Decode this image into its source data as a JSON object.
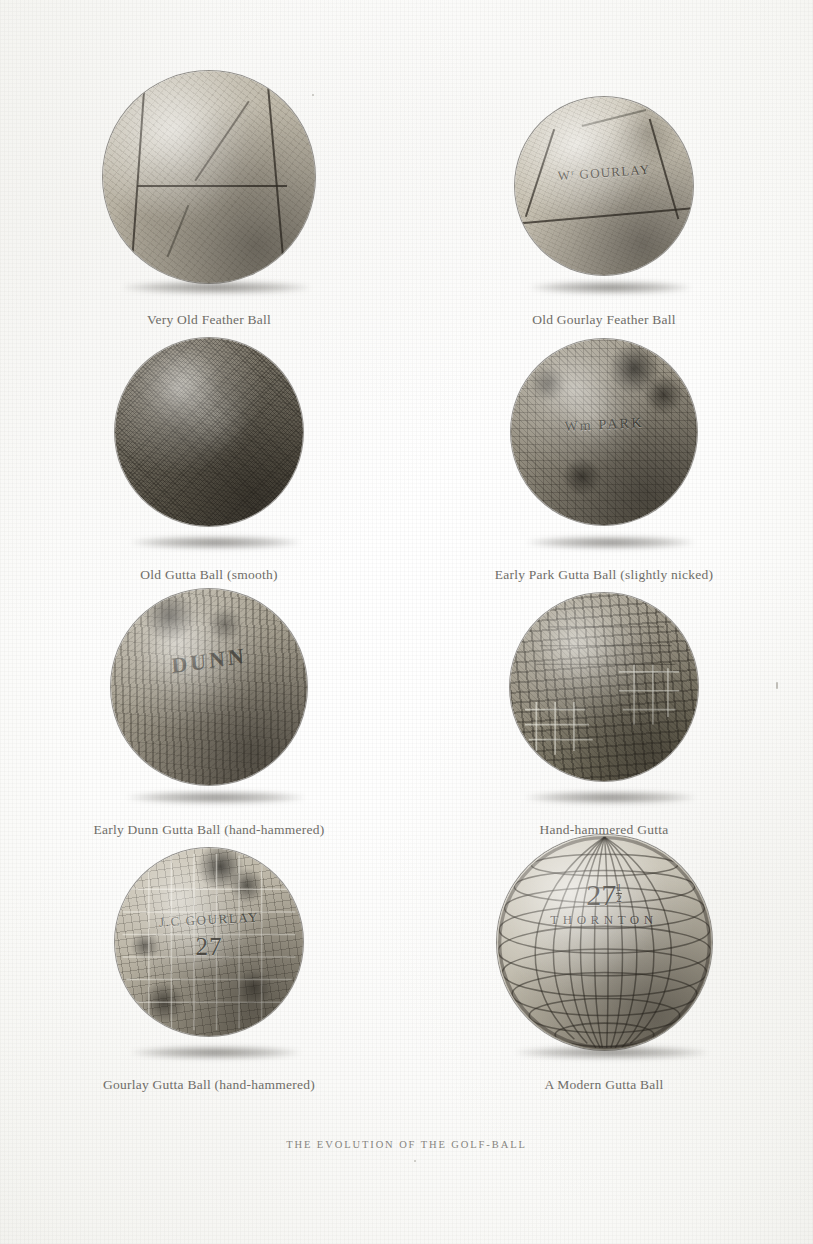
{
  "plate": {
    "title": "THE EVOLUTION OF THE GOLF-BALL",
    "background_color": "#fdfdfc",
    "ink_color": "#6f6d68",
    "columns": 2,
    "rows": 4,
    "total_figures": 8
  },
  "figures": [
    {
      "id": "very-old-feather-ball",
      "caption": "Very Old Feather Ball",
      "row": 1,
      "column": "left",
      "diameter_px": 212,
      "surface": "leather-panelled",
      "stamp": "",
      "base_color": "#bdb7a8"
    },
    {
      "id": "old-gourlay-feather-ball",
      "caption": "Old Gourlay Feather Ball",
      "row": 1,
      "column": "right",
      "diameter_px": 178,
      "surface": "leather-panelled",
      "stamp": "W GOURLAY",
      "stamp_prefix": "W",
      "stamp_superscript": "r",
      "stamp_main": "GOURLAY",
      "base_color": "#c6c0b1"
    },
    {
      "id": "old-gutta-ball-smooth",
      "caption": "Old Gutta Ball (smooth)",
      "row": 2,
      "column": "left",
      "diameter_px": 188,
      "surface": "smooth-stippled",
      "stamp": "",
      "base_color": "#6f6a5e"
    },
    {
      "id": "early-park-gutta-ball",
      "caption": "Early Park Gutta Ball (slightly nicked)",
      "row": 2,
      "column": "right",
      "diameter_px": 186,
      "surface": "slightly-nicked",
      "stamp": "Wm PARK",
      "base_color": "#938d7f"
    },
    {
      "id": "early-dunn-gutta-ball",
      "caption": "Early Dunn Gutta Ball (hand-hammered)",
      "row": 3,
      "column": "left",
      "diameter_px": 196,
      "surface": "hand-hammered-vertical",
      "stamp": "DUNN",
      "base_color": "#a49e8f"
    },
    {
      "id": "hand-hammered-gutta",
      "caption": "Hand-hammered Gutta",
      "row": 3,
      "column": "right",
      "diameter_px": 188,
      "surface": "hand-hammered-lattice",
      "stamp": "",
      "base_color": "#979182"
    },
    {
      "id": "gourlay-gutta-ball",
      "caption": "Gourlay Gutta Ball (hand-hammered)",
      "row": 4,
      "column": "left",
      "diameter_px": 188,
      "surface": "hand-hammered-mesh",
      "stamp": "J.C GOURLAY",
      "stamp_number": "27",
      "base_color": "#b6b0a1"
    },
    {
      "id": "a-modern-gutta-ball",
      "caption": "A Modern Gutta Ball",
      "row": 4,
      "column": "right",
      "diameter_px": 215,
      "surface": "machine-moulded-mesh",
      "stamp": "THORNTON",
      "stamp_number": "27",
      "stamp_fraction_numerator": "1",
      "stamp_fraction_denominator": "2",
      "base_color": "#c4bfb1"
    }
  ]
}
